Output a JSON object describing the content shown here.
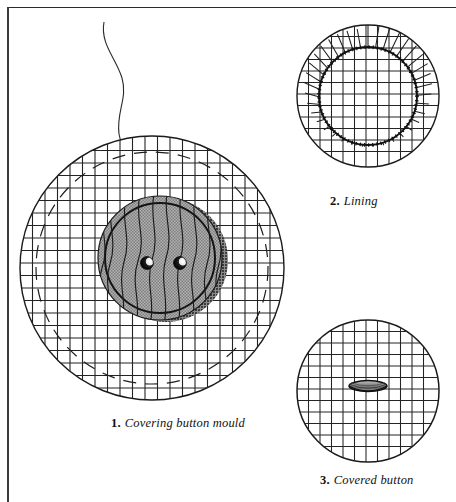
{
  "page": {
    "background_color": "#ffffff",
    "border_color": "#2b2b2b",
    "ink_color": "#111111"
  },
  "figures": [
    {
      "id": "covering-button-mould",
      "number": "1.",
      "label": "Covering button mould",
      "caption_x": 111,
      "caption_y": 413,
      "center_x": 152,
      "center_y": 268,
      "radius": 133,
      "description": "Large square-gridded fabric circle with a dashed stitching circle, a thread tail at top, and a grey wooden two-hole button mould resting in the centre.",
      "grid_spacing": 12.5,
      "dashed_circle_radius": 116,
      "mould": {
        "center_x": 160,
        "center_y": 258,
        "radius": 63,
        "fill_color": "#9d9d9d",
        "rim_color": "#1a1a1a",
        "shadow_color": "#5a5a5a",
        "holes": 2,
        "hole_color": "#000000",
        "hole_highlight_color": "#ffffff",
        "grain_lines": 9
      },
      "thread": {
        "visible": true,
        "color": "#2a2a2a"
      }
    },
    {
      "id": "lining",
      "number": "2.",
      "label": "Lining",
      "caption_x": 330,
      "caption_y": 191,
      "center_x": 368,
      "center_y": 96,
      "radius": 72,
      "description": "Gridded circular lining disc with an inner circle outline and the surplus fabric snipped into radial notches all around.",
      "grid_spacing": 11.5,
      "inner_circle_radius": 50,
      "notches": 40
    },
    {
      "id": "covered-button",
      "number": "3.",
      "label": "Covered button",
      "caption_x": 320,
      "caption_y": 477,
      "center_x": 368,
      "center_y": 391,
      "radius": 72,
      "description": "Finished button covered in the gridded check fabric, seen from the back, with the metal shank slot at the centre.",
      "grid_spacing": 11.5,
      "shank": {
        "center_x": 368,
        "center_y": 385,
        "width": 38,
        "height": 11,
        "fill_color": "#8a8a8a",
        "outline_color": "#101010"
      }
    }
  ]
}
